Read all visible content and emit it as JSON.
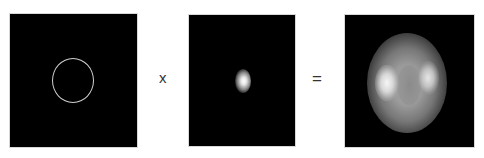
{
  "diagram": {
    "type": "convolution-equation",
    "operands": [
      {
        "id": "object",
        "description": "thin bright ring on black background"
      },
      {
        "id": "kernel",
        "description": "small bright elongated blob on black background"
      },
      {
        "id": "result",
        "description": "blurred elliptical ring with bright left and right lobes"
      }
    ],
    "operators": {
      "multiply": "x",
      "equals": "="
    },
    "colors": {
      "background": "#ffffff",
      "panel": "#000000",
      "ring": "#d0d0d0",
      "operator_text": "#333333"
    }
  }
}
